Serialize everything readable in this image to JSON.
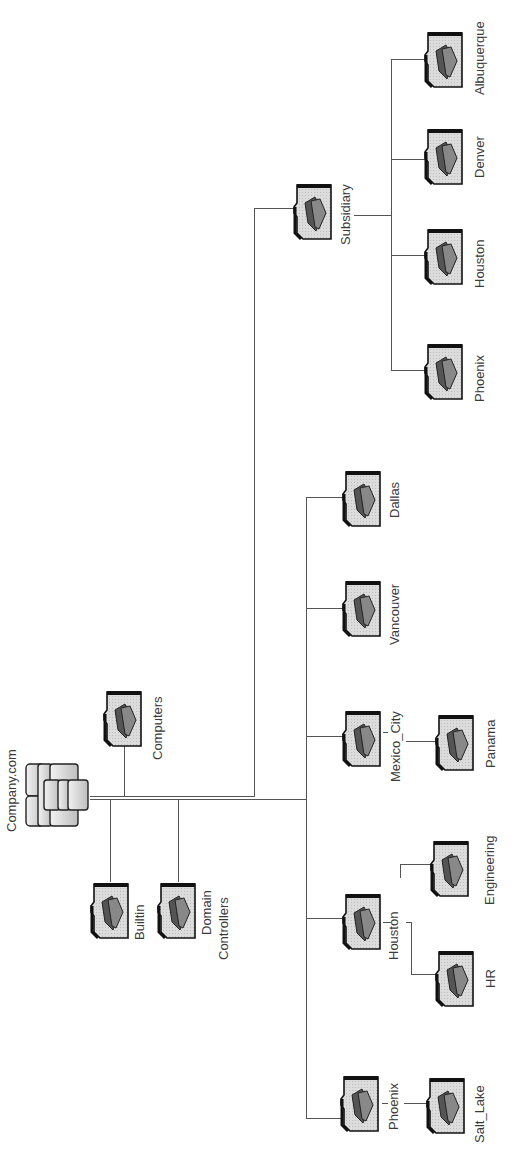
{
  "diagram": {
    "type": "active-directory-tree",
    "orientation": "rotated-90-ccw",
    "root": {
      "label": "Company.com",
      "icon": "domain-server-icon"
    },
    "containers": [
      {
        "label": "Computers",
        "icon": "folder-icon"
      },
      {
        "label": "Builtin",
        "icon": "folder-icon"
      },
      {
        "label": "Domain Controllers",
        "line1": "Domain",
        "line2": "Controllers",
        "icon": "folder-icon"
      }
    ],
    "ous": [
      {
        "label": "Phoenix",
        "children": [
          {
            "label": "Salt_Lake"
          }
        ]
      },
      {
        "label": "Houston",
        "children": [
          {
            "label": "HR"
          },
          {
            "label": "Engineering"
          }
        ]
      },
      {
        "label": "Mexico_City",
        "children": [
          {
            "label": "Panama"
          }
        ]
      },
      {
        "label": "Vancouver",
        "children": []
      },
      {
        "label": "Dallas",
        "children": []
      },
      {
        "label": "Subsidiary",
        "children": [
          {
            "label": "Phoenix"
          },
          {
            "label": "Houston"
          },
          {
            "label": "Denver"
          },
          {
            "label": "Albuquerque"
          }
        ]
      }
    ],
    "colors": {
      "line": "#555555",
      "folder_fill": "#d9d9d9",
      "folder_border": "#111111",
      "glyph": "#666666"
    }
  }
}
